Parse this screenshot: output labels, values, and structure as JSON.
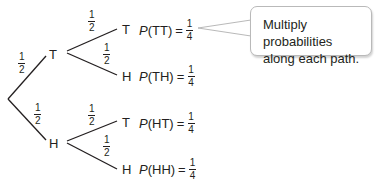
{
  "diagram": {
    "type": "probability-tree",
    "root_branches": [
      {
        "outcome": "T",
        "probability": {
          "num": "1",
          "den": "2"
        }
      },
      {
        "outcome": "H",
        "probability": {
          "num": "1",
          "den": "2"
        }
      }
    ],
    "nodes": {
      "T": {
        "label": "T",
        "branches": [
          {
            "outcome": "T",
            "probability": {
              "num": "1",
              "den": "2"
            },
            "result": {
              "p": "P",
              "event": "(TT)",
              "eq": "=",
              "num": "1",
              "den": "4"
            }
          },
          {
            "outcome": "H",
            "probability": {
              "num": "1",
              "den": "2"
            },
            "result": {
              "p": "P",
              "event": "(TH)",
              "eq": "=",
              "num": "1",
              "den": "4"
            }
          }
        ]
      },
      "H": {
        "label": "H",
        "branches": [
          {
            "outcome": "T",
            "probability": {
              "num": "1",
              "den": "2"
            },
            "result": {
              "p": "P",
              "event": "(HT)",
              "eq": "=",
              "num": "1",
              "den": "4"
            }
          },
          {
            "outcome": "H",
            "probability": {
              "num": "1",
              "den": "2"
            },
            "result": {
              "p": "P",
              "event": "(HH)",
              "eq": "=",
              "num": "1",
              "den": "4"
            }
          }
        ]
      }
    },
    "callout": {
      "line1": "Multiply probabilities",
      "line2": "along each path."
    },
    "colors": {
      "line": "#231f20",
      "text": "#231f20",
      "callout_border": "#b9b9b9"
    }
  }
}
